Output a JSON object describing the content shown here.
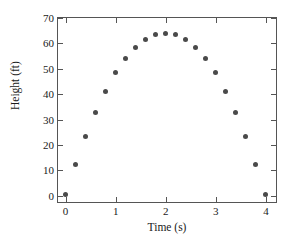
{
  "chart_data": {
    "type": "scatter",
    "title": "",
    "xlabel": "Time (s)",
    "ylabel": "Height (ft)",
    "xlim": [
      -0.15,
      4.2
    ],
    "ylim": [
      -2.5,
      70
    ],
    "grid": false,
    "legend": null,
    "marker": {
      "shape": "circle",
      "color": "#4a4a4a",
      "size_px": 5
    },
    "axis_color": "#555555",
    "background": "#ffffff",
    "xticks": [
      0,
      1,
      2,
      3,
      4
    ],
    "xtick_labels": [
      "0",
      "1",
      "2",
      "3",
      "4"
    ],
    "yticks": [
      0,
      10,
      20,
      30,
      40,
      50,
      60,
      70
    ],
    "ytick_labels": [
      "0",
      "10",
      "20",
      "30",
      "40",
      "50",
      "60",
      "70"
    ],
    "x": [
      0,
      0.2,
      0.4,
      0.6,
      0.8,
      1.0,
      1.2,
      1.4,
      1.6,
      1.8,
      2.0,
      2.2,
      2.4,
      2.6,
      2.8,
      3.0,
      3.2,
      3.4,
      3.6,
      3.8,
      4.0
    ],
    "y": [
      0.6,
      12.4,
      23.4,
      32.8,
      41.2,
      48.4,
      54.0,
      58.4,
      61.6,
      63.4,
      64.0,
      63.4,
      61.6,
      58.4,
      54.0,
      48.4,
      41.2,
      32.8,
      23.4,
      12.4,
      0.6
    ],
    "point_count": 21
  }
}
